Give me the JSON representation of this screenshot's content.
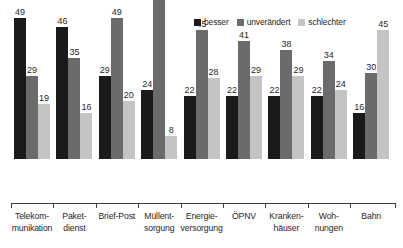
{
  "chart_data": {
    "type": "bar",
    "title": "",
    "subtitle": "",
    "xlabel": "",
    "ylabel": "",
    "ylim": [
      0,
      65
    ],
    "grid": false,
    "legend_position": "top-right",
    "categories": [
      "Telekom-\nmunikation",
      "Paket-\ndienst",
      "Brief-Post",
      "Müllent-\nsorgung",
      "Energie-\nversorgung",
      "ÖPNV",
      "Kranken-\nhäuser",
      "Woh-\nnungen",
      "Bahn"
    ],
    "category_lines": [
      [
        "Telekom-",
        "munikation"
      ],
      [
        "Paket-",
        "dienst"
      ],
      [
        "Brief-Post",
        ""
      ],
      [
        "Müllent-",
        "sorgung"
      ],
      [
        "Energie-",
        "versorgung"
      ],
      [
        "ÖPNV",
        ""
      ],
      [
        "Kranken-",
        "häuser"
      ],
      [
        "Woh-",
        "nungen"
      ],
      [
        "Bahn",
        ""
      ]
    ],
    "series": [
      {
        "name": "besser",
        "color": "#1a1a1a",
        "values": [
          49,
          46,
          29,
          24,
          22,
          22,
          22,
          22,
          16
        ]
      },
      {
        "name": "unverändert",
        "color": "#6b6b6b",
        "values": [
          29,
          35,
          49,
          62,
          45,
          41,
          38,
          34,
          30
        ]
      },
      {
        "name": "schlechter",
        "color": "#c4c4c4",
        "values": [
          19,
          16,
          20,
          8,
          28,
          29,
          29,
          24,
          45
        ]
      }
    ]
  },
  "legend": {
    "items": [
      {
        "label": "besser",
        "color": "#1a1a1a"
      },
      {
        "label": "unverändert",
        "color": "#6b6b6b"
      },
      {
        "label": "schlechter",
        "color": "#c4c4c4"
      }
    ]
  },
  "axis": {
    "baseline_color": "#3c3c3c"
  }
}
